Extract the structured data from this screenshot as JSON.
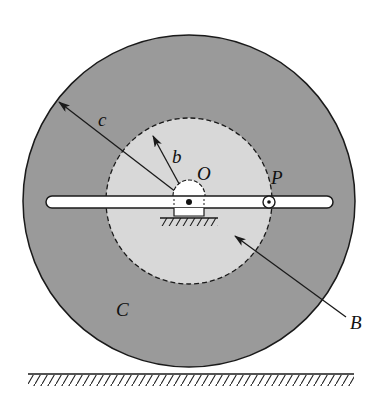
{
  "diagram": {
    "type": "mechanical-schematic",
    "labels": {
      "c": "c",
      "b": "b",
      "O": "O",
      "P": "P",
      "C": "C",
      "B": "B"
    },
    "colors": {
      "outer_disk": "#9a9a9a",
      "inner_disk": "#d8d8d8",
      "rod": "#ffffff",
      "stroke": "#1a1a1a",
      "background": "#ffffff"
    },
    "geometry": {
      "center": [
        189,
        201
      ],
      "outer_radius": 166,
      "inner_radius": 83,
      "rod": {
        "x1": 46,
        "x2": 333,
        "y_top": 196,
        "y_bottom": 208
      },
      "pin_P": [
        269,
        202
      ],
      "ground_y": 374
    }
  }
}
